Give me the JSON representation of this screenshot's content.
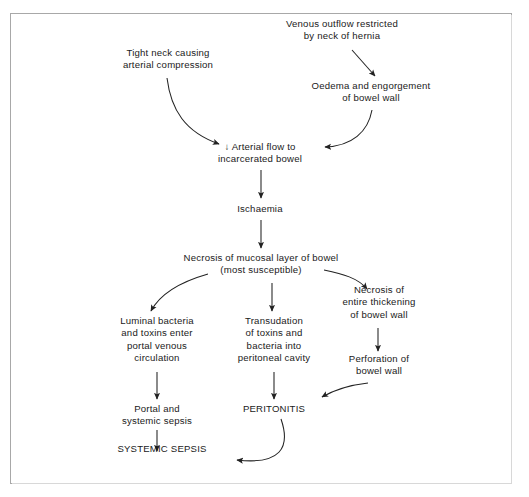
{
  "diagram": {
    "title_text": "",
    "type": "flowchart",
    "colors": {
      "background": "#ffffff",
      "border": "#a8a8a8",
      "text": "#1a1a1a",
      "arrow": "#222222"
    },
    "nodes": [
      {
        "id": "venous-outflow-restricted",
        "name": "node-venous-outflow-restricted",
        "lines": [
          "Venous outflow restricted",
          "by neck of hernia"
        ],
        "x": 268,
        "y": 18,
        "width": 148
      },
      {
        "id": "tight-neck",
        "name": "node-tight-neck-arterial-compression",
        "lines": [
          "Tight neck causing",
          "arterial compression"
        ],
        "x": 103,
        "y": 47,
        "width": 130
      },
      {
        "id": "oedema-engorgement",
        "name": "node-oedema-engorgement",
        "lines": [
          "Oedema and engorgement",
          "of bowel wall"
        ],
        "x": 297,
        "y": 80,
        "width": 148
      },
      {
        "id": "arterial-flow",
        "name": "node-arterial-flow-incarcerated-bowel",
        "lines": [
          "↓ Arterial flow to",
          "incarcerated bowel"
        ],
        "x": 198,
        "y": 141,
        "width": 124
      },
      {
        "id": "ischaemia",
        "name": "node-ischaemia",
        "lines": [
          "Ischaemia"
        ],
        "x": 226,
        "y": 203,
        "width": 68
      },
      {
        "id": "necrosis-mucosal",
        "name": "node-necrosis-mucosal-layer",
        "lines": [
          "Necrosis of mucosal layer of bowel",
          "(most susceptible)"
        ],
        "x": 178,
        "y": 252,
        "width": 166
      },
      {
        "id": "necrosis-entire",
        "name": "node-necrosis-entire-thickening",
        "lines": [
          "Necrosis of",
          "entire thickening",
          "of bowel wall"
        ],
        "x": 330,
        "y": 284,
        "width": 98
      },
      {
        "id": "luminal-bacteria",
        "name": "node-luminal-bacteria-portal-venous",
        "lines": [
          "Luminal bacteria",
          "and toxins enter",
          "portal venous",
          "circulation"
        ],
        "x": 105,
        "y": 315,
        "width": 104
      },
      {
        "id": "transudation",
        "name": "node-transudation-toxins-bacteria",
        "lines": [
          "Transudation",
          "of toxins and",
          "bacteria into",
          "peritoneal cavity"
        ],
        "x": 222,
        "y": 315,
        "width": 104
      },
      {
        "id": "perforation",
        "name": "node-perforation-bowel-wall",
        "lines": [
          "Perforation of",
          "bowel wall"
        ],
        "x": 330,
        "y": 353,
        "width": 98
      },
      {
        "id": "portal-systemic-sepsis",
        "name": "node-portal-systemic-sepsis",
        "lines": [
          "Portal and",
          "systemic sepsis"
        ],
        "x": 105,
        "y": 403,
        "width": 104
      },
      {
        "id": "peritonitis",
        "name": "node-peritonitis",
        "lines": [
          "PERITONITIS"
        ],
        "x": 229,
        "y": 403,
        "width": 90
      },
      {
        "id": "systemic-sepsis",
        "name": "node-systemic-sepsis",
        "lines": [
          "SYSTEMIC SEPSIS"
        ],
        "x": 106,
        "y": 443,
        "width": 112
      }
    ],
    "edges": [
      {
        "id": "e1",
        "name": "edge-venous-outflow-to-oedema",
        "from": "venous-outflow-restricted",
        "to": "oedema-engorgement",
        "style": "straight"
      },
      {
        "id": "e2",
        "name": "edge-tight-neck-to-arterial-flow",
        "from": "tight-neck",
        "to": "arterial-flow",
        "style": "curve"
      },
      {
        "id": "e3",
        "name": "edge-oedema-to-arterial-flow",
        "from": "oedema-engorgement",
        "to": "arterial-flow",
        "style": "curve"
      },
      {
        "id": "e4",
        "name": "edge-arterial-flow-to-ischaemia",
        "from": "arterial-flow",
        "to": "ischaemia",
        "style": "straight"
      },
      {
        "id": "e5",
        "name": "edge-ischaemia-to-necrosis-mucosal",
        "from": "ischaemia",
        "to": "necrosis-mucosal",
        "style": "straight"
      },
      {
        "id": "e6",
        "name": "edge-necrosis-mucosal-to-luminal-bacteria",
        "from": "necrosis-mucosal",
        "to": "luminal-bacteria",
        "style": "curve"
      },
      {
        "id": "e7",
        "name": "edge-necrosis-mucosal-to-transudation",
        "from": "necrosis-mucosal",
        "to": "transudation",
        "style": "straight"
      },
      {
        "id": "e8",
        "name": "edge-necrosis-mucosal-to-necrosis-entire",
        "from": "necrosis-mucosal",
        "to": "necrosis-entire",
        "style": "curve"
      },
      {
        "id": "e9",
        "name": "edge-necrosis-entire-to-perforation",
        "from": "necrosis-entire",
        "to": "perforation",
        "style": "straight"
      },
      {
        "id": "e10",
        "name": "edge-luminal-bacteria-to-portal-sepsis",
        "from": "luminal-bacteria",
        "to": "portal-systemic-sepsis",
        "style": "straight"
      },
      {
        "id": "e11",
        "name": "edge-transudation-to-peritonitis",
        "from": "transudation",
        "to": "peritonitis",
        "style": "straight"
      },
      {
        "id": "e12",
        "name": "edge-perforation-to-peritonitis",
        "from": "perforation",
        "to": "peritonitis",
        "style": "curve"
      },
      {
        "id": "e13",
        "name": "edge-portal-sepsis-to-systemic-sepsis",
        "from": "portal-systemic-sepsis",
        "to": "systemic-sepsis",
        "style": "straight"
      },
      {
        "id": "e14",
        "name": "edge-peritonitis-to-systemic-sepsis",
        "from": "peritonitis",
        "to": "systemic-sepsis",
        "style": "curve"
      }
    ]
  }
}
